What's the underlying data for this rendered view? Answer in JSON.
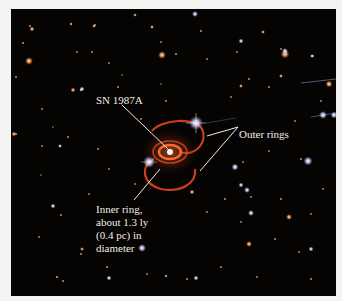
{
  "figure": {
    "background_color": "#f3f3f1",
    "sky_color": "#060403",
    "ring_color": "#e2451f",
    "labels": {
      "supernova": "SN 1987A",
      "outer_rings": "Outer rings",
      "inner_ring_lines": [
        "Inner ring,",
        "about 1.3 ly",
        "(0.4 pc) in",
        "diameter"
      ]
    }
  }
}
